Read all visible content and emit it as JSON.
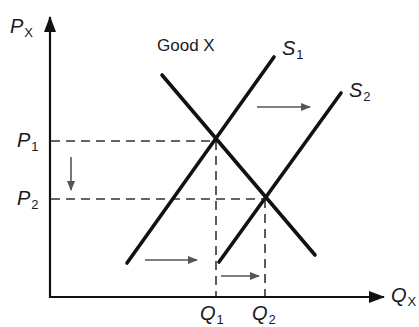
{
  "diagram": {
    "title": "Good X",
    "axes": {
      "y": {
        "symbol": "P",
        "subscript": "X"
      },
      "x": {
        "symbol": "Q",
        "subscript": "X"
      }
    },
    "curves": [
      {
        "id": "S1",
        "symbol": "S",
        "subscript": "1"
      },
      {
        "id": "S2",
        "symbol": "S",
        "subscript": "2"
      },
      {
        "id": "D"
      }
    ],
    "price_levels": [
      {
        "symbol": "P",
        "subscript": "1"
      },
      {
        "symbol": "P",
        "subscript": "2"
      }
    ],
    "quantity_levels": [
      {
        "symbol": "Q",
        "subscript": "1"
      },
      {
        "symbol": "Q",
        "subscript": "2"
      }
    ],
    "arrows": [
      "supply-shift-right-upper",
      "supply-shift-right-lower",
      "quantity-increase",
      "price-decrease"
    ],
    "colors": {
      "line": "#111111",
      "dash": "#333333",
      "arrow": "#555555"
    }
  }
}
